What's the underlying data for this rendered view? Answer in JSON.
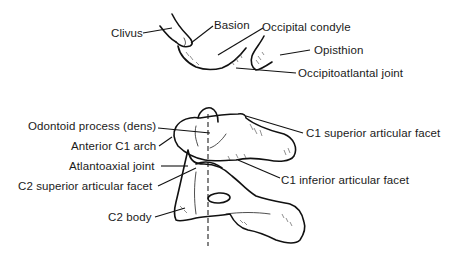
{
  "figure": {
    "upper_group": {
      "labels": [
        {
          "id": "clivus",
          "text": "Clivus"
        },
        {
          "id": "basion",
          "text": "Basion"
        },
        {
          "id": "occipital_condyle",
          "text": "Occipital condyle"
        },
        {
          "id": "opisthion",
          "text": "Opisthion"
        },
        {
          "id": "occipitoatlantal_joint",
          "text": "Occipitoatlantal joint"
        }
      ]
    },
    "lower_group": {
      "labels": [
        {
          "id": "odontoid_process",
          "text": "Odontoid process (dens)"
        },
        {
          "id": "anterior_c1_arch",
          "text": "Anterior C1 arch"
        },
        {
          "id": "atlantoaxial_joint",
          "text": "Atlantoaxial joint"
        },
        {
          "id": "c2_superior_articular_facet",
          "text": "C2 superior articular facet"
        },
        {
          "id": "c2_body",
          "text": "C2 body"
        },
        {
          "id": "c1_superior_articular_facet",
          "text": "C1 superior articular facet"
        },
        {
          "id": "c1_inferior_articular_facet",
          "text": "C1 inferior articular facet"
        }
      ]
    },
    "colors": {
      "line": "#111111",
      "text": "#1a1a1a",
      "background": "#ffffff"
    }
  }
}
